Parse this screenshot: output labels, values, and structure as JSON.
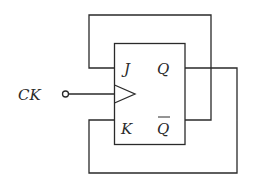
{
  "diagram": {
    "type": "JK flip-flop",
    "clock_label": "CK",
    "inputs": {
      "j": "J",
      "k": "K"
    },
    "outputs": {
      "q": "Q",
      "q_bar": "Q"
    },
    "connections": [
      "Q-bar output fed back to J input",
      "Q output fed back to K input"
    ]
  }
}
